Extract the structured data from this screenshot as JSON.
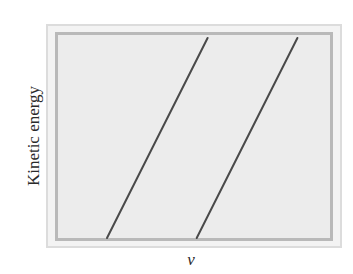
{
  "chart_data": {
    "type": "line",
    "title": "",
    "xlabel": "ν",
    "ylabel": "Kinetic energy",
    "grid": false,
    "legend": null,
    "axis_ticks": false,
    "series": [
      {
        "name": "line-1",
        "x": [
          0.18,
          0.55
        ],
        "y": [
          0.0,
          1.0
        ]
      },
      {
        "name": "line-2",
        "x": [
          0.51,
          0.88
        ],
        "y": [
          0.0,
          1.0
        ]
      }
    ],
    "xlim": [
      0,
      1
    ],
    "ylim": [
      0,
      1
    ]
  },
  "labels": {
    "x": "ν",
    "y": "Kinetic energy"
  },
  "colors": {
    "line": "#4a4a4a",
    "plot_fill": "#ececec",
    "frame_inner": "#b9b9b9",
    "frame_outer": "#dcdcdc"
  }
}
